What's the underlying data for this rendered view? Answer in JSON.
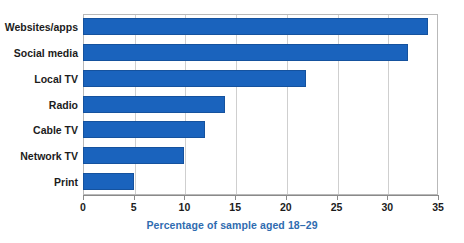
{
  "chart_data": {
    "type": "bar",
    "orientation": "horizontal",
    "title": "",
    "subtitle": "",
    "xlabel": "Percentage of sample aged 18–29",
    "ylabel": "",
    "categories": [
      "Websites/apps",
      "Social media",
      "Local TV",
      "Radio",
      "Cable TV",
      "Network TV",
      "Print"
    ],
    "values": [
      34,
      32,
      22,
      14,
      12,
      10,
      5
    ],
    "series": [
      {
        "name": "Percentage of sample aged 18-29",
        "values": [
          34,
          32,
          22,
          14,
          12,
          10,
          5
        ]
      }
    ],
    "xlim": [
      0,
      35
    ],
    "xticks": [
      0,
      5,
      10,
      15,
      20,
      25,
      30,
      35
    ],
    "xtick_labels": [
      "0",
      "5",
      "10",
      "15",
      "20",
      "25",
      "30",
      "35"
    ],
    "grid": "vertical",
    "legend": "none",
    "bar_color": "#1a63bd",
    "bar_border_color": "#15529e",
    "axis_title_color": "#2f6cb0",
    "grid_color": "#cfcfcf",
    "plot_border_color": "#b9b9b9",
    "annotations": []
  }
}
